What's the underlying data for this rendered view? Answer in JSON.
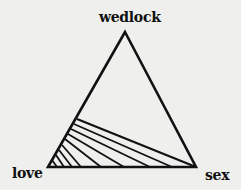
{
  "diagram": {
    "type": "triangle",
    "vertices": {
      "top": {
        "label": "wedlock",
        "x": 125,
        "y": 32
      },
      "left": {
        "label": "love",
        "x": 48,
        "y": 167
      },
      "right": {
        "label": "sex",
        "x": 196,
        "y": 167
      }
    },
    "stroke_color": "#111111",
    "background_color": "#efefed",
    "hatched_region": {
      "description": "Hatched area near the love-sex base, bounded by the left side and a line from the left side to the sex vertex",
      "hatch_lines": [
        {
          "x1": 77,
          "y1": 119,
          "x2": 196,
          "y2": 167
        },
        {
          "x1": 74,
          "y1": 124,
          "x2": 172,
          "y2": 167
        },
        {
          "x1": 71,
          "y1": 129,
          "x2": 150,
          "y2": 167
        },
        {
          "x1": 68,
          "y1": 134,
          "x2": 124,
          "y2": 167
        },
        {
          "x1": 65,
          "y1": 139,
          "x2": 101,
          "y2": 167
        },
        {
          "x1": 62,
          "y1": 145,
          "x2": 81,
          "y2": 167
        },
        {
          "x1": 59,
          "y1": 150,
          "x2": 72,
          "y2": 167
        },
        {
          "x1": 56,
          "y1": 155,
          "x2": 64,
          "y2": 167
        },
        {
          "x1": 52,
          "y1": 160,
          "x2": 57,
          "y2": 167
        }
      ]
    }
  }
}
